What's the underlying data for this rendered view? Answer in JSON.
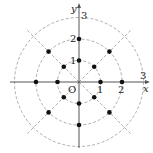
{
  "diagram": {
    "type": "polar-grid",
    "origin_label": "O",
    "axes": {
      "x_label": "x",
      "y_label": "y"
    },
    "tick_labels": {
      "x": [
        "1",
        "2",
        "3"
      ],
      "y": [
        "1",
        "2",
        "3"
      ]
    },
    "circles": {
      "radii": [
        1,
        2,
        3
      ],
      "style": "dashed",
      "color": "#999999"
    },
    "rays": {
      "angles_deg": [
        45,
        135,
        225,
        315
      ],
      "style": "dashed",
      "color": "#999999"
    },
    "points": [
      {
        "r": 1,
        "theta_deg": 0
      },
      {
        "r": 1,
        "theta_deg": 45
      },
      {
        "r": 1,
        "theta_deg": 90
      },
      {
        "r": 1,
        "theta_deg": 135
      },
      {
        "r": 1,
        "theta_deg": 180
      },
      {
        "r": 1,
        "theta_deg": 225
      },
      {
        "r": 1,
        "theta_deg": 270
      },
      {
        "r": 1,
        "theta_deg": 315
      },
      {
        "r": 2,
        "theta_deg": 0
      },
      {
        "r": 2,
        "theta_deg": 45
      },
      {
        "r": 2,
        "theta_deg": 90
      },
      {
        "r": 2,
        "theta_deg": 135
      },
      {
        "r": 2,
        "theta_deg": 180
      },
      {
        "r": 2,
        "theta_deg": 225
      },
      {
        "r": 2,
        "theta_deg": 270
      },
      {
        "r": 2,
        "theta_deg": 315
      }
    ],
    "colors": {
      "axis": "#555555",
      "grid": "#999999",
      "point": "#111111"
    }
  }
}
